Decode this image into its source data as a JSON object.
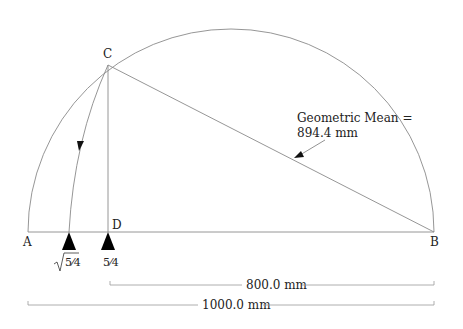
{
  "diagram": {
    "points": {
      "A": {
        "label": "A",
        "x": 28,
        "y": 232
      },
      "B": {
        "label": "B",
        "x": 434,
        "y": 232
      },
      "C": {
        "label": "C",
        "x": 108,
        "y": 65
      },
      "D": {
        "label": "D",
        "x": 108,
        "y": 232
      }
    },
    "semicircle": {
      "cx": 231,
      "cy": 232,
      "r": 203
    },
    "annotation": {
      "line1": "Geometric Mean =",
      "line2": "894.4 mm"
    },
    "markers": [
      {
        "label": "√5/4",
        "radicand": "5⁄4",
        "x": 69
      },
      {
        "label": "5/4",
        "text": "5⁄4",
        "x": 108
      }
    ],
    "dimensions": [
      {
        "label": "800.0 mm",
        "from_x": 108,
        "to_x": 434,
        "y": 285
      },
      {
        "label": "1000.0 mm",
        "from_x": 28,
        "to_x": 434,
        "y": 305
      }
    ],
    "colors": {
      "line": "#888888",
      "marker": "#000000",
      "text": "#222222"
    }
  }
}
